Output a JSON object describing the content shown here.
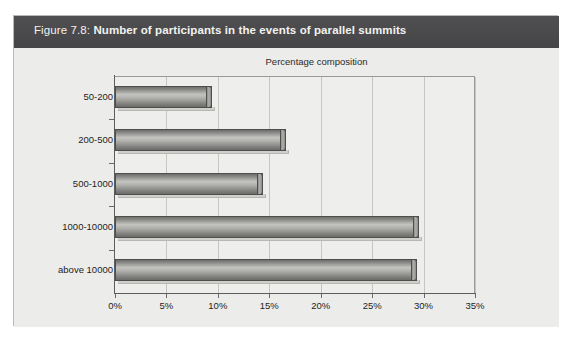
{
  "figure": {
    "number_label": "Figure 7.8:",
    "title": "Number of participants in the events of parallel summits",
    "caption_bar_color": "#4a4a4c",
    "panel_color": "#ececea"
  },
  "chart_data": {
    "type": "bar",
    "orientation": "horizontal",
    "title": "Percentage composition",
    "subtitle": "Percentage composition",
    "xlabel": "",
    "ylabel": "",
    "categories": [
      "50-200",
      "200-500",
      "500-1000",
      "1000-10000",
      "above 10000"
    ],
    "values": [
      9.4,
      16.6,
      14.4,
      29.6,
      29.4
    ],
    "value_unit": "%",
    "xlim": [
      0,
      35
    ],
    "xticks": [
      0,
      5,
      10,
      15,
      20,
      25,
      30,
      35
    ],
    "xtick_labels": [
      "0%",
      "5%",
      "10%",
      "15%",
      "20%",
      "25%",
      "30%",
      "35%"
    ],
    "grid": "vertical",
    "legend": "none",
    "series": [
      {
        "name": "Percentage composition",
        "values": [
          9.4,
          16.6,
          14.4,
          29.6,
          29.4
        ],
        "color": "#a8a8a5"
      }
    ],
    "bar_style": "3d-cylinder",
    "bar_color": "#a8a8a5",
    "gridline_color": "#c6c6c3",
    "axis_color": "#5d5d5b"
  }
}
